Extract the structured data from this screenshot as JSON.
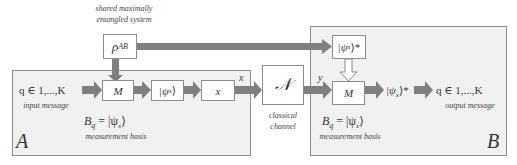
{
  "diagram": {
    "shared_system": {
      "caption_line1": "shared maximally",
      "caption_line2": "entangled system",
      "label": "ρ",
      "label_sub": "AB"
    },
    "party_a": {
      "name": "A",
      "input_math": "q ∈ 1,...,K",
      "input_caption": "input message",
      "measure_label": "M",
      "state_label": "|ψ",
      "state_sub": "x",
      "state_close": "⟩",
      "outcome_label": "x",
      "basis_math_B": "B",
      "basis_math_sub": "q",
      "basis_math_rest": " = |ψ",
      "basis_math_sub2": "x",
      "basis_math_close": "⟩",
      "basis_caption": "measurement basis",
      "edge_label_out": "x"
    },
    "channel": {
      "label": "𝒩",
      "caption_line1": "classical",
      "caption_line2": "channel",
      "edge_label_out": "y"
    },
    "party_b": {
      "name": "B",
      "conj_state_label": "|ψ",
      "conj_state_sub": "x",
      "conj_state_close": "⟩*",
      "measure_label": "M",
      "result_label": "|ψ",
      "result_sub": "x",
      "result_close": "⟩*",
      "output_math": "q ∈ 1,...,K",
      "output_caption": "output message",
      "basis_math_B": "B",
      "basis_math_sub": "q",
      "basis_math_rest": " = |ψ",
      "basis_math_sub2": "x",
      "basis_math_close": "⟩",
      "basis_caption": "measurement basis"
    },
    "colors": {
      "arrow": "#7f7f7f",
      "panel_fill": "#f1f1f1",
      "border": "#8c8c8c"
    }
  }
}
